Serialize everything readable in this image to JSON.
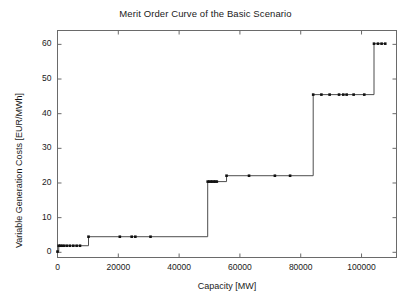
{
  "chart_data": {
    "type": "line",
    "title": "Merit Order Curve of the Basic Scenario",
    "xlabel": "Capacity [MW]",
    "ylabel": "Variable Generation Costs [EUR/MWh]",
    "xlim": [
      0,
      111500
    ],
    "ylim": [
      -1.5,
      64
    ],
    "xticks": [
      0,
      20000,
      40000,
      60000,
      80000,
      100000
    ],
    "xticklabels": [
      "0",
      "20000",
      "40000",
      "60000",
      "80000",
      "100000"
    ],
    "yticks": [
      0,
      10,
      20,
      30,
      40,
      50,
      60
    ],
    "yticklabels": [
      "0",
      "10",
      "20",
      "30",
      "40",
      "50",
      "60"
    ],
    "grid": false,
    "legend": null,
    "line_color": "#4d4d4d",
    "marker_color": "#111111",
    "marker_style": "square",
    "drawstyle": "steps-post",
    "x": [
      0,
      400,
      900,
      1500,
      2200,
      3100,
      4100,
      5200,
      6300,
      7400,
      10200,
      20500,
      24400,
      25600,
      30600,
      49400,
      49900,
      50400,
      50900,
      51400,
      51900,
      52400,
      55600,
      63000,
      71500,
      76500,
      84100,
      86800,
      89500,
      92600,
      94000,
      95100,
      97400,
      100900,
      104100,
      105400,
      106600,
      107800
    ],
    "y": [
      0.2,
      1.9,
      1.9,
      1.9,
      1.9,
      1.9,
      1.9,
      1.9,
      1.9,
      1.9,
      4.5,
      4.5,
      4.5,
      4.5,
      4.5,
      20.4,
      20.4,
      20.4,
      20.4,
      20.4,
      20.4,
      20.4,
      22.1,
      22.1,
      22.1,
      22.1,
      45.5,
      45.5,
      45.5,
      45.5,
      45.5,
      45.5,
      45.5,
      45.5,
      60.2,
      60.2,
      60.2,
      60.2
    ],
    "steps": [
      {
        "level": 0.2,
        "from": 0,
        "to": 400
      },
      {
        "level": 1.9,
        "from": 400,
        "to": 10200
      },
      {
        "level": 4.5,
        "from": 10200,
        "to": 49400
      },
      {
        "level": 20.4,
        "from": 49400,
        "to": 55600
      },
      {
        "level": 22.1,
        "from": 55600,
        "to": 84100
      },
      {
        "level": 45.5,
        "from": 84100,
        "to": 104100
      },
      {
        "level": 60.2,
        "from": 104100,
        "to": 107800
      }
    ]
  }
}
